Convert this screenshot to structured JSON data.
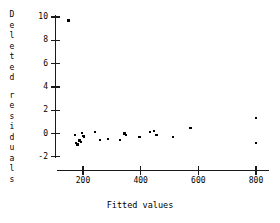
{
  "chart_data": {
    "type": "scatter",
    "title": "",
    "xlabel": "Fitted values",
    "ylabel": "Deleted residuals",
    "xlim": [
      110,
      860
    ],
    "ylim": [
      -2.6,
      10.4
    ],
    "xticks": [
      200,
      400,
      600,
      800
    ],
    "xtick_labels": [
      "200",
      "400",
      "600",
      "800"
    ],
    "yticks": [
      -2,
      0,
      2,
      4,
      6,
      8,
      10
    ],
    "ytick_labels": [
      "-2",
      "0",
      "2",
      "4",
      "6",
      "8",
      "10"
    ],
    "grid": false,
    "legend": "none",
    "marker": "point",
    "marker_color": "#000000",
    "series": [
      {
        "name": "deleted residuals",
        "points": [
          [
            150,
            9.7
          ],
          [
            172,
            -0.15
          ],
          [
            177,
            -0.85
          ],
          [
            181,
            -0.95
          ],
          [
            186,
            -0.6
          ],
          [
            190,
            -0.55
          ],
          [
            193,
            -0.75
          ],
          [
            196,
            0.05
          ],
          [
            200,
            -0.2
          ],
          [
            203,
            -0.25
          ],
          [
            243,
            0.1
          ],
          [
            258,
            -0.55
          ],
          [
            288,
            -0.5
          ],
          [
            327,
            -0.55
          ],
          [
            344,
            0.0
          ],
          [
            349,
            -0.15
          ],
          [
            396,
            -0.3
          ],
          [
            432,
            0.15
          ],
          [
            446,
            0.2
          ],
          [
            455,
            -0.15
          ],
          [
            513,
            -0.3
          ],
          [
            573,
            0.45
          ],
          [
            800,
            1.3
          ],
          [
            800,
            -0.8
          ]
        ]
      }
    ]
  },
  "axis_label_chars": {
    "y_line1": [
      "D",
      "e",
      "l",
      "e",
      "t",
      "e",
      "d"
    ],
    "y_line2": [
      "r",
      "e",
      "s",
      "i",
      "d",
      "u",
      "a",
      "l",
      "s"
    ]
  },
  "colors": {
    "axis": "#1a1a1a",
    "marker": "#000000",
    "background": "#ffffff",
    "text": "#000000"
  }
}
